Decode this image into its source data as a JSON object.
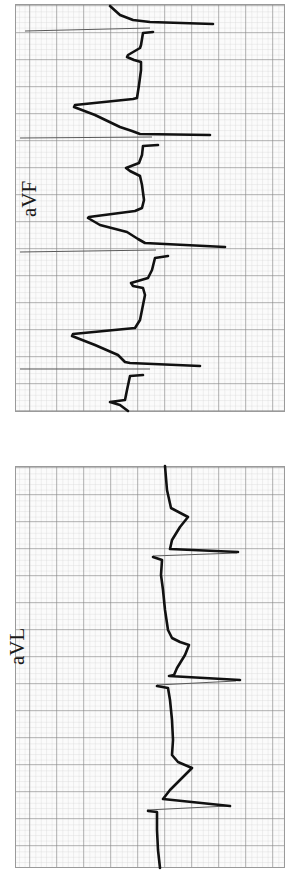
{
  "figure": {
    "type": "ECG rhythm strips (rotated 90°)",
    "paper": {
      "background": "#fbfbfb",
      "minor_grid_color": "#c9c9c9",
      "major_grid_color": "#7a7a7a",
      "minor_spacing_px": 5.4,
      "major_spacing_px": 27
    },
    "trace_color": "#111111",
    "spike_color": "#555555"
  },
  "strips": [
    {
      "id": "aVF",
      "label": "aVF",
      "beats_visible": 4,
      "features": "paced rhythm: pacing spikes followed by broad QRS complexes with ST/T changes"
    },
    {
      "id": "aVL",
      "label": "aVL",
      "beats_visible": 3,
      "features": "paced rhythm: pacing spikes followed by low-amplitude complexes"
    }
  ],
  "traces": {
    "aVF": {
      "main": [
        "110,6 120,15 133,20 150,22 213,24",
        "153,32 143,33 141,45 140,48 128,55 127,57 134,60 141,62 141,70 139,85 137,98 133,99 75,105 74,107 95,115 120,127 132,131 140,134 210,135",
        "158,145 143,146 142,155 139,163 126,168 130,171 140,176 142,185 144,200 142,208 135,211 89,217 88,218 100,225 127,232 138,239 145,243 225,247",
        "168,256 155,258 152,270 148,278 131,283 133,286 143,288 145,295 142,310 140,320 135,328 73,334 72,336 95,345 118,355 125,362 130,363 200,366",
        "143,375 130,376 127,390 125,400 110,402 120,405 128,411"
      ],
      "spikes": [
        "25,31 150,28",
        "20,138 152,137",
        "20,252 156,250",
        "20,369 150,369"
      ]
    },
    "aVL": {
      "main": [
        "165,466 167,490 171,508 188,517 180,527 172,540 170,549 238,552",
        "153,557 162,560 161,575 163,590 165,610 168,630 172,638 180,642 189,645 185,655 177,668 174,675 169,676 240,680",
        "157,686 168,688 170,700 172,720 173,740 172,755 178,762 192,768 180,780 170,790 163,799 230,806",
        "148,811 157,812 157,830 158,850 160,868"
      ],
      "spikes": [
        "153,556 237,553",
        "157,685 236,681",
        "147,810 228,806"
      ]
    }
  }
}
